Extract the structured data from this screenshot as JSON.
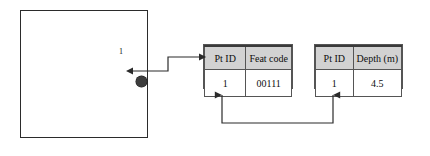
{
  "diagram": {
    "map": {
      "name": "map-extent-box",
      "point_label": "1"
    },
    "tables": [
      {
        "id": "feature-code-table",
        "headers": [
          "Pt ID",
          "Feat code"
        ],
        "rows": [
          [
            "1",
            "00111"
          ]
        ]
      },
      {
        "id": "depth-table",
        "headers": [
          "Pt ID",
          "Depth (m)"
        ],
        "rows": [
          [
            "1",
            "4.5"
          ]
        ]
      }
    ],
    "colors": {
      "header_fill": "#d2d2d2",
      "line": "#2b2b2b",
      "point_fill": "#3d3d3d",
      "cell_fill": "#ffffff"
    }
  }
}
